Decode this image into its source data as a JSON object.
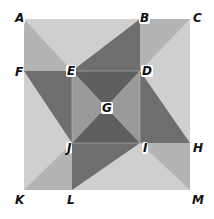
{
  "diagram": {
    "type": "geometric-figure",
    "colors": {
      "background_light": "#cfcfcf",
      "corner_mid": "#b4b4b4",
      "pinwheel_dark": "#6e6e6e",
      "center_dark": "#5f5f5f",
      "center_light": "#9a9a9a"
    },
    "points": {
      "A": {
        "label": "A",
        "x": 24,
        "y": 19
      },
      "B": {
        "label": "B",
        "x": 140,
        "y": 19
      },
      "C": {
        "label": "C",
        "x": 190,
        "y": 19
      },
      "D": {
        "label": "D",
        "x": 140,
        "y": 71
      },
      "E": {
        "label": "E",
        "x": 72,
        "y": 71
      },
      "F": {
        "label": "F",
        "x": 24,
        "y": 71
      },
      "G": {
        "label": "G",
        "x": 106,
        "y": 107
      },
      "H": {
        "label": "H",
        "x": 190,
        "y": 143
      },
      "I": {
        "label": "I",
        "x": 140,
        "y": 143
      },
      "J": {
        "label": "J",
        "x": 72,
        "y": 143
      },
      "K": {
        "label": "K",
        "x": 24,
        "y": 190
      },
      "L": {
        "label": "L",
        "x": 72,
        "y": 190
      },
      "M": {
        "label": "M",
        "x": 190,
        "y": 190
      }
    }
  }
}
